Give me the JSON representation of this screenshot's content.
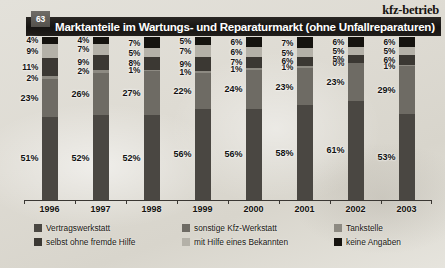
{
  "header": {
    "brand": "kfz-betrieb",
    "badge": "63",
    "title": "Marktanteile im Wartungs- und Reparaturmarkt (ohne Unfallreparaturen)"
  },
  "legend": {
    "items": [
      {
        "label": "Vertragswerkstatt",
        "color": "#4a4742"
      },
      {
        "label": "sonstige Kfz-Werkstatt",
        "color": "#6e6b64"
      },
      {
        "label": "Tankstelle",
        "color": "#8d8a82"
      },
      {
        "label": "selbst ohne fremde Hilfe",
        "color": "#3b3833"
      },
      {
        "label": "mit Hilfe eines Bekannten",
        "color": "#b4b1a8"
      },
      {
        "label": "keine Angaben",
        "color": "#15130f"
      }
    ]
  },
  "chart_data": {
    "type": "bar",
    "subtype": "stacked-bar-100",
    "title": "Marktanteile im Wartungs- und Reparaturmarkt (ohne Unfallreparaturen)",
    "xlabel": "",
    "ylabel": "",
    "ylim": [
      0,
      100
    ],
    "grid": false,
    "legend_position": "bottom",
    "unit": "%",
    "categories": [
      "1996",
      "1997",
      "1998",
      "1999",
      "2000",
      "2001",
      "2002",
      "2003"
    ],
    "series": [
      {
        "name": "Vertragswerkstatt",
        "color": "#4a4742",
        "values": [
          51,
          52,
          52,
          56,
          56,
          58,
          61,
          53
        ]
      },
      {
        "name": "sonstige Kfz-Werkstatt",
        "color": "#6e6b64",
        "values": [
          23,
          26,
          27,
          22,
          24,
          23,
          23,
          29
        ]
      },
      {
        "name": "Tankstelle",
        "color": "#8d8a82",
        "values": [
          2,
          2,
          1,
          1,
          1,
          1,
          0,
          1
        ]
      },
      {
        "name": "selbst ohne fremde Hilfe",
        "color": "#3b3833",
        "values": [
          11,
          9,
          8,
          9,
          7,
          6,
          5,
          6
        ]
      },
      {
        "name": "mit Hilfe eines Bekannten",
        "color": "#b4b1a8",
        "values": [
          9,
          7,
          5,
          7,
          6,
          5,
          5,
          5
        ]
      },
      {
        "name": "keine Angaben",
        "color": "#15130f",
        "values": [
          4,
          4,
          7,
          5,
          6,
          7,
          6,
          6
        ]
      }
    ],
    "data_labels": {
      "1996": [
        "4%",
        "9%",
        "11%",
        "2%",
        "23%",
        "51%"
      ],
      "1997": [
        "4%",
        "7%",
        "9%",
        "2%",
        "26%",
        "52%"
      ],
      "1998": [
        "7%",
        "5%",
        "8%",
        "1%",
        "27%",
        "52%"
      ],
      "1999": [
        "5%",
        "7%",
        "9%",
        "1%",
        "22%",
        "56%"
      ],
      "2000": [
        "6%",
        "6%",
        "7%",
        "1%",
        "24%",
        "56%"
      ],
      "2001": [
        "7%",
        "5%",
        "6%",
        "1%",
        "23%",
        "58%"
      ],
      "2002": [
        "6%",
        "5%",
        "5%",
        "0%",
        "23%",
        "61%"
      ],
      "2003": [
        "6%",
        "5%",
        "6%",
        "1%",
        "29%",
        "53%"
      ]
    }
  }
}
